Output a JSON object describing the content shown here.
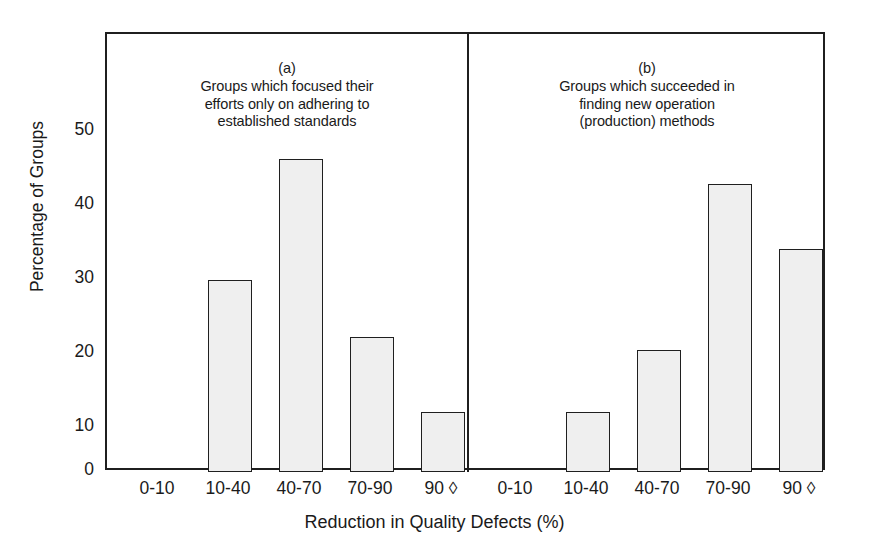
{
  "chart_data": {
    "type": "bar",
    "title": "",
    "xlabel": "Reduction in Quality Defects (%)",
    "ylabel": "Percentage of Groups",
    "categories": [
      "0-10",
      "10-40",
      "40-70",
      "70-90",
      "90 ◊"
    ],
    "ylim": [
      0,
      55
    ],
    "yticks": [
      0,
      10,
      20,
      30,
      40,
      50
    ],
    "ytick_labels": [
      "0",
      "10",
      "20",
      "30",
      "40",
      "50"
    ],
    "grid": false,
    "legend": "none",
    "panels": [
      {
        "letter": "(a)",
        "caption": "Groups which focused their\nefforts only on adhering to\nestablished standards",
        "values": [
          0,
          28.0,
          45.8,
          19.7,
          8.8
        ]
      },
      {
        "letter": "(b)",
        "caption": "Groups which succeeded in\nfinding new operation\n(production) methods",
        "values": [
          0,
          8.8,
          17.8,
          42.1,
          32.6
        ]
      }
    ],
    "bar_fill_color": "#efefef",
    "bar_edge_color": "#1f1f1f",
    "axis_color": "#1f1f1f",
    "background_color": "#ffffff"
  },
  "figure": {
    "y_axis_title": "Percentage of Groups",
    "x_axis_title": "Reduction in Quality Defects (%)"
  }
}
